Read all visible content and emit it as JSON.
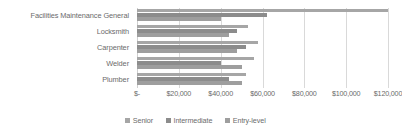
{
  "chart_data": {
    "type": "bar",
    "orientation": "horizontal",
    "title": "",
    "xlabel": "",
    "ylabel": "",
    "xlim": [
      0,
      120000
    ],
    "grid": true,
    "legend_position": "bottom",
    "categories": [
      "Facilities Maintenance General",
      "Locksmith",
      "Carpenter",
      "Welder",
      "Plumber"
    ],
    "tick_labels": [
      "$-",
      "$20,000",
      "$40,000",
      "$60,000",
      "$80,000",
      "$100,000",
      "$120,000"
    ],
    "tick_values": [
      0,
      20000,
      40000,
      60000,
      80000,
      100000,
      120000
    ],
    "series": [
      {
        "name": "Senior",
        "color": "#a6a6a6",
        "values": [
          120000,
          53000,
          58000,
          56000,
          52000
        ]
      },
      {
        "name": "Intermediate",
        "color": "#8c8c8c",
        "values": [
          62000,
          48000,
          52000,
          40000,
          44000
        ]
      },
      {
        "name": "Entry-level",
        "color": "#9e9e9e",
        "values": [
          40000,
          44000,
          48000,
          50000,
          50000
        ]
      }
    ]
  }
}
